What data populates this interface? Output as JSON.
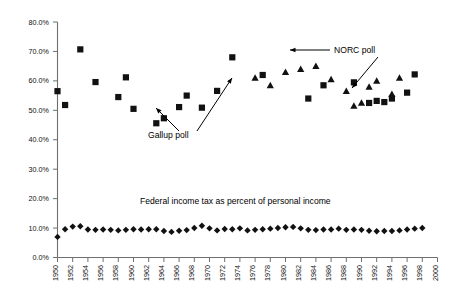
{
  "chart_data": {
    "type": "scatter",
    "title": "",
    "xlabel": "",
    "ylabel": "",
    "xlim": [
      1950,
      2000
    ],
    "ylim": [
      0,
      80
    ],
    "ytick_format": "percent",
    "yticks": [
      0,
      10,
      20,
      30,
      40,
      50,
      60,
      70,
      80
    ],
    "ytick_labels": [
      "0.0%",
      "10.0%",
      "20.0%",
      "30.0%",
      "40.0%",
      "50.0%",
      "60.0%",
      "70.0%",
      "80.0%"
    ],
    "xticks": [
      1950,
      1952,
      1954,
      1956,
      1958,
      1960,
      1962,
      1964,
      1966,
      1968,
      1970,
      1972,
      1974,
      1976,
      1978,
      1980,
      1982,
      1984,
      1986,
      1988,
      1990,
      1992,
      1994,
      1996,
      1998,
      2000
    ],
    "xtick_labels": [
      "1950",
      "1952",
      "1954",
      "1956",
      "1958",
      "1960",
      "1962",
      "1964",
      "1966",
      "1968",
      "1970",
      "1972",
      "1974",
      "1976",
      "1978",
      "1980",
      "1982",
      "1984",
      "1986",
      "1988",
      "1990",
      "1992",
      "1994",
      "1996",
      "1998",
      "2000"
    ],
    "xtick_rotation": 90,
    "grid": false,
    "legend": "none",
    "series": [
      {
        "name": "Gallup poll",
        "marker": "square",
        "color": "#111111",
        "points": [
          [
            1950,
            56.5
          ],
          [
            1951,
            51.8
          ],
          [
            1953,
            70.7
          ],
          [
            1955,
            59.6
          ],
          [
            1958,
            54.5
          ],
          [
            1959,
            61.2
          ],
          [
            1960,
            50.5
          ],
          [
            1963,
            45.6
          ],
          [
            1964,
            47.3
          ],
          [
            1966,
            51.1
          ],
          [
            1967,
            55.0
          ],
          [
            1969,
            50.9
          ],
          [
            1971,
            56.6
          ],
          [
            1973,
            68.0
          ],
          [
            1977,
            62.0
          ],
          [
            1983,
            54.0
          ],
          [
            1985,
            58.5
          ],
          [
            1989,
            59.5
          ],
          [
            1991,
            52.5
          ],
          [
            1992,
            53.2
          ],
          [
            1993,
            52.8
          ],
          [
            1994,
            54.0
          ],
          [
            1996,
            56.0
          ],
          [
            1997,
            62.2
          ]
        ]
      },
      {
        "name": "NORC poll",
        "marker": "triangle",
        "color": "#111111",
        "points": [
          [
            1976,
            61.0
          ],
          [
            1978,
            58.5
          ],
          [
            1980,
            63.0
          ],
          [
            1982,
            64.0
          ],
          [
            1984,
            65.0
          ],
          [
            1986,
            60.5
          ],
          [
            1988,
            56.5
          ],
          [
            1989,
            51.5
          ],
          [
            1990,
            52.5
          ],
          [
            1991,
            58.0
          ],
          [
            1992,
            60.0
          ],
          [
            1994,
            55.5
          ],
          [
            1995,
            61.0
          ]
        ]
      },
      {
        "name": "Federal income tax as percent of personal income",
        "marker": "diamond",
        "color": "#111111",
        "points": [
          [
            1950,
            7.0
          ],
          [
            1951,
            9.6
          ],
          [
            1952,
            10.5
          ],
          [
            1953,
            10.6
          ],
          [
            1954,
            9.5
          ],
          [
            1955,
            9.4
          ],
          [
            1956,
            9.5
          ],
          [
            1957,
            9.4
          ],
          [
            1958,
            9.2
          ],
          [
            1959,
            9.4
          ],
          [
            1960,
            9.6
          ],
          [
            1961,
            9.5
          ],
          [
            1962,
            9.6
          ],
          [
            1963,
            9.6
          ],
          [
            1964,
            9.0
          ],
          [
            1965,
            8.7
          ],
          [
            1966,
            9.1
          ],
          [
            1967,
            9.3
          ],
          [
            1968,
            10.0
          ],
          [
            1969,
            10.8
          ],
          [
            1970,
            9.9
          ],
          [
            1971,
            9.2
          ],
          [
            1972,
            9.7
          ],
          [
            1973,
            9.6
          ],
          [
            1974,
            9.9
          ],
          [
            1975,
            9.2
          ],
          [
            1976,
            9.4
          ],
          [
            1977,
            9.6
          ],
          [
            1978,
            9.8
          ],
          [
            1979,
            10.0
          ],
          [
            1980,
            10.3
          ],
          [
            1981,
            10.4
          ],
          [
            1982,
            9.9
          ],
          [
            1983,
            9.4
          ],
          [
            1984,
            9.3
          ],
          [
            1985,
            9.5
          ],
          [
            1986,
            9.5
          ],
          [
            1987,
            9.8
          ],
          [
            1988,
            9.4
          ],
          [
            1989,
            9.5
          ],
          [
            1990,
            9.4
          ],
          [
            1991,
            9.1
          ],
          [
            1992,
            8.9
          ],
          [
            1993,
            9.0
          ],
          [
            1994,
            9.0
          ],
          [
            1995,
            9.2
          ],
          [
            1996,
            9.5
          ],
          [
            1997,
            9.8
          ],
          [
            1998,
            10.0
          ]
        ]
      }
    ],
    "annotations": [
      {
        "id": "gallup",
        "text": "Gallup poll",
        "text_x": 148,
        "text_y": 138,
        "arrows": [
          {
            "x1": 179,
            "y1": 131,
            "x2": 156,
            "y2": 108
          },
          {
            "x1": 197,
            "y1": 131,
            "x2": 232,
            "y2": 78
          }
        ]
      },
      {
        "id": "norc",
        "text": "NORC poll",
        "text_x": 334,
        "text_y": 53,
        "arrows": [
          {
            "x1": 330,
            "y1": 50,
            "x2": 290,
            "y2": 50
          },
          {
            "x1": 378,
            "y1": 57,
            "x2": 352,
            "y2": 88
          }
        ]
      },
      {
        "id": "tax-series",
        "text": "Federal income tax as percent of personal income",
        "text_x": 140,
        "text_y": 204,
        "arrows": []
      }
    ]
  }
}
